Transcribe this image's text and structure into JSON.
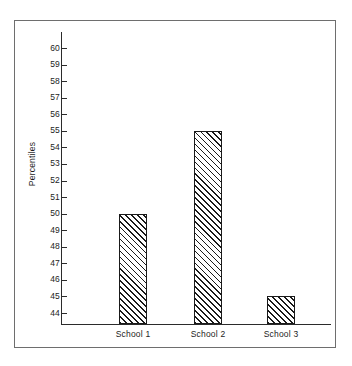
{
  "chart_data": {
    "type": "bar",
    "title": "",
    "subtitle": "",
    "xlabel": "",
    "ylabel": "Percentiles",
    "categories": [
      "School 1",
      "School 2",
      "School 3"
    ],
    "values": [
      50,
      55,
      45
    ],
    "series": [
      {
        "name": "Percentiles",
        "values": [
          50,
          55,
          45
        ]
      }
    ],
    "ylim": [
      44,
      60
    ],
    "ytick_labels": [
      "60",
      "59",
      "58",
      "57",
      "56",
      "55",
      "54",
      "53",
      "52",
      "51",
      "50",
      "49",
      "48",
      "47",
      "46",
      "45",
      "44"
    ],
    "ytick_values": [
      60,
      59,
      58,
      57,
      56,
      55,
      54,
      53,
      52,
      51,
      50,
      49,
      48,
      47,
      46,
      45,
      44
    ],
    "grid": false,
    "legend": false,
    "legend_position": "none",
    "bar_fill": "diagonal-hatch",
    "bar_edge_color": "#1a1a1a",
    "axis_color": "#2b2b2b",
    "frame_color": "#6e6e6e",
    "background_color": "#ffffff",
    "annotations": []
  }
}
